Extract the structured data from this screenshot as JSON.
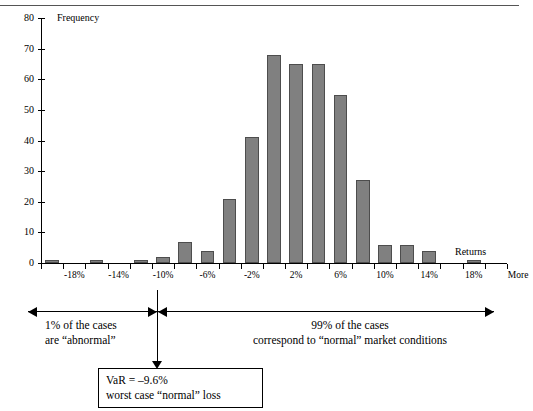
{
  "chart_data": {
    "type": "bar",
    "title": "",
    "xlabel": "Returns",
    "ylabel": "Frequency",
    "ylim": [
      0,
      80
    ],
    "ytick_values": [
      0,
      10,
      20,
      30,
      40,
      50,
      60,
      70,
      80
    ],
    "grid": false,
    "legend": "none",
    "bar_color": "#808080",
    "categories": [
      "-20%",
      "-18%",
      "-16%",
      "-14%",
      "-12%",
      "-10%",
      "-8%",
      "-6%",
      "-4%",
      "-2%",
      "0%",
      "2%",
      "4%",
      "6%",
      "8%",
      "10%",
      "12%",
      "14%",
      "16%",
      "18%",
      "More"
    ],
    "xtick_labels": [
      "-18%",
      "-14%",
      "-10%",
      "-6%",
      "-2%",
      "2%",
      "6%",
      "10%",
      "14%",
      "18%",
      "More"
    ],
    "values": [
      1,
      0,
      1,
      0,
      1,
      2,
      7,
      4,
      21,
      41,
      68,
      65,
      65,
      55,
      27,
      6,
      6,
      4,
      0,
      1,
      0
    ],
    "annotations": [
      "1% of the cases are “abnormal”",
      "99% of the cases correspond to “normal” market conditions",
      "VaR = –9.6% worst case “normal” loss"
    ]
  },
  "axes": {
    "y_caption": "Frequency",
    "x_caption": "Returns",
    "y_ticks": [
      "80",
      "70",
      "60",
      "50",
      "40",
      "30",
      "20",
      "10",
      "0"
    ],
    "x_ticks": [
      "-18%",
      "-14%",
      "-10%",
      "-6%",
      "-2%",
      "2%",
      "6%",
      "10%",
      "14%",
      "18%",
      "More"
    ]
  },
  "notes": {
    "left_line1": "1% of the cases",
    "left_line2": "are “abnormal”",
    "right_line1": "99% of the cases",
    "right_line2": "correspond to “normal” market conditions",
    "var_line1": "VaR = –9.6%",
    "var_line2": "worst case “normal” loss"
  }
}
